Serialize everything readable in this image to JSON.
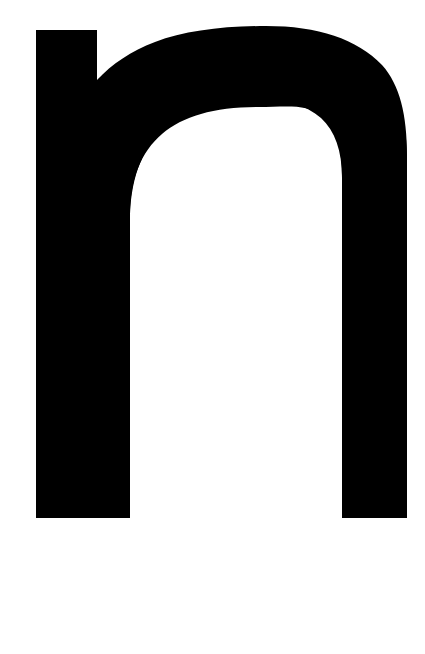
{
  "page": {
    "kind": "letterform-image",
    "background_color": "#ffffff",
    "width": 425,
    "height": 654
  },
  "glyph": {
    "character": "n",
    "name": "latin-small-letter-n",
    "case": "lowercase",
    "style": "sans-serif-grotesque-bold",
    "fill_color": "#000000",
    "alt_text": "n"
  },
  "geometry": {
    "left_stem": {
      "x": 36,
      "y": 30,
      "width": 61,
      "height": 488
    },
    "right_stem": {
      "x": 342,
      "y": 120,
      "width": 65,
      "height": 398
    },
    "arch_outer_top_y": 33,
    "arch_outer_right_x": 407,
    "baseline_y": 518,
    "counter": {
      "left": 98,
      "top": 107,
      "right": 343,
      "bottom": 518
    },
    "outer_shoulder_radius": 108,
    "inner_shoulder_radius": 66,
    "stroke_weight_stem": 61,
    "stroke_weight_arch_top": 74
  }
}
